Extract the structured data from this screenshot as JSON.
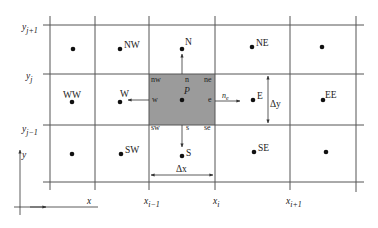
{
  "diagram": {
    "colors": {
      "grid_line": "#555555",
      "control_volume_fill": "#9b9b9b",
      "node_dot": "#111111",
      "text": "#222222",
      "background": "#ffffff"
    },
    "row_labels": {
      "y_j_plus_1": {
        "base": "y",
        "sub": "j+1"
      },
      "y_j": {
        "base": "y",
        "sub": "j"
      },
      "y_j_minus_1": {
        "base": "y",
        "sub": "j−1"
      }
    },
    "column_labels": {
      "x_i_minus_1": {
        "base": "x",
        "sub": "i−1"
      },
      "x_i": {
        "base": "x",
        "sub": "i"
      },
      "x_i_plus_1": {
        "base": "x",
        "sub": "i+1"
      }
    },
    "nodes": {
      "NW": "NW",
      "N": "N",
      "NE": "NE",
      "WW": "WW",
      "W": "W",
      "P": "P",
      "E": "E",
      "EE": "EE",
      "SW": "SW",
      "S": "S",
      "SE": "SE"
    },
    "faces": {
      "nw": "nw",
      "n": "n",
      "ne": "ne",
      "w": "w",
      "e": "e",
      "sw": "sw",
      "s": "s",
      "se": "se"
    },
    "normal_vector": {
      "base": "n",
      "sub": "e"
    },
    "dimensions": {
      "dx": "Δx",
      "dy": "Δy"
    },
    "axes": {
      "x_label": "x",
      "y_label": "y"
    }
  }
}
